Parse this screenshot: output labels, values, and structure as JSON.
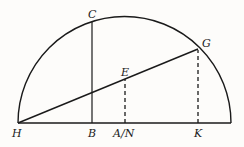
{
  "diagram": {
    "type": "semicircle-geometry",
    "stroke_color": "#1a1a1a",
    "background": "#fdfcfa",
    "labels": {
      "H": "H",
      "B": "B",
      "AN": "A/N",
      "K": "K",
      "C": "C",
      "E": "E",
      "G": "G"
    }
  }
}
